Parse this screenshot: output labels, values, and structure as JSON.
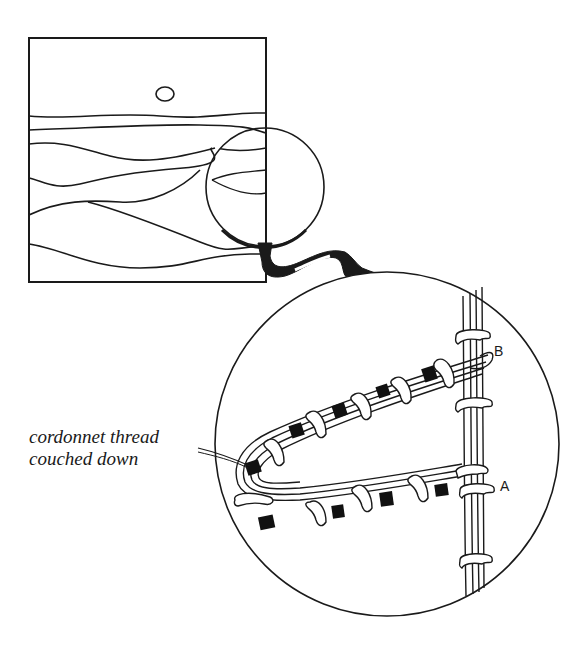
{
  "figure": {
    "annotation": {
      "line1": "cordonnet thread",
      "line2": "couched down"
    },
    "point_labels": {
      "a": "A",
      "b": "B"
    },
    "colors": {
      "ink": "#1a1a1a",
      "paper": "#ffffff"
    }
  }
}
